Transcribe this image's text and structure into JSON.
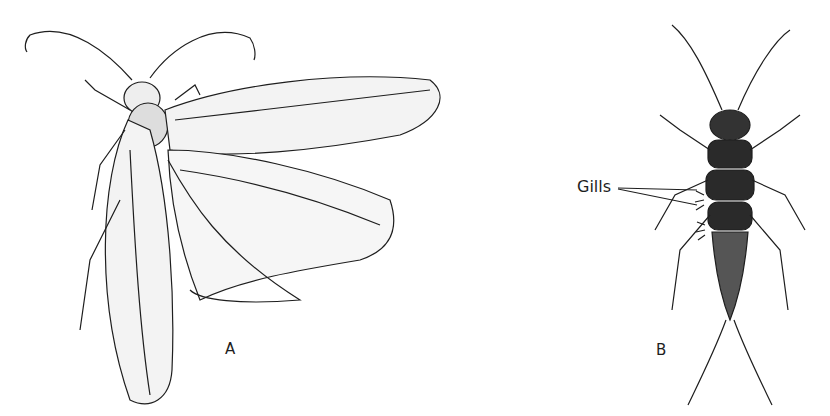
{
  "figure": {
    "panels": [
      {
        "id": "A",
        "label": "A",
        "subject": "winged adult insect (dorsal view, wings spread)"
      },
      {
        "id": "B",
        "label": "B",
        "subject": "aquatic nymph (dorsal view)"
      }
    ],
    "annotations": [
      {
        "text": "Gills",
        "target_panel": "B",
        "leader_lines": 2
      }
    ],
    "colors": {
      "ink": "#1e1e1e",
      "background": "#ffffff"
    }
  }
}
